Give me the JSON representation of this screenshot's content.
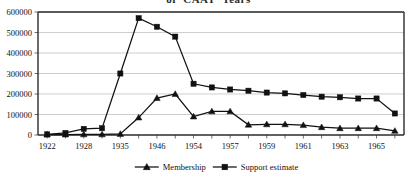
{
  "title": "of 'CAAT' Years",
  "chart_data": {
    "type": "line",
    "title": "of 'CAAT' Years",
    "xlabel": "",
    "ylabel": "",
    "ylim": [
      0,
      600000
    ],
    "ytick_step": 100000,
    "yticks": [
      "0",
      "100000",
      "200000",
      "300000",
      "400000",
      "500000",
      "600000"
    ],
    "grid": true,
    "legend_position": "bottom",
    "x_index": [
      0,
      1,
      2,
      3,
      4,
      5,
      6,
      7,
      8,
      9,
      10,
      11,
      12,
      13,
      14,
      15,
      16,
      17,
      18,
      19
    ],
    "categories": [
      "1922",
      "",
      "1928",
      "",
      "1935",
      "",
      "1946",
      "",
      "1954",
      "",
      "1957",
      "",
      "1959",
      "",
      "1961",
      "",
      "1963",
      "",
      "1965",
      ""
    ],
    "xticklabels_shown": [
      "1922",
      "1928",
      "1935",
      "1946",
      "1954",
      "1957",
      "1959",
      "1961",
      "1963",
      "1965"
    ],
    "series": [
      {
        "name": "Membership",
        "marker": "triangle",
        "color": "#111111",
        "values": [
          2000,
          2000,
          3000,
          3000,
          5000,
          85000,
          180000,
          200000,
          90000,
          115000,
          115000,
          50000,
          52000,
          52000,
          48000,
          38000,
          33000,
          33000,
          33000,
          20000
        ]
      },
      {
        "name": "Support estimate",
        "marker": "square",
        "color": "#111111",
        "values": [
          3000,
          10000,
          30000,
          33000,
          300000,
          570000,
          528000,
          480000,
          250000,
          232000,
          222000,
          216000,
          207000,
          203000,
          195000,
          187000,
          184000,
          178000,
          178000,
          105000
        ]
      }
    ]
  },
  "legend": {
    "items": [
      {
        "label": "Membership",
        "marker": "triangle"
      },
      {
        "label": "Support estimate",
        "marker": "square"
      }
    ]
  }
}
